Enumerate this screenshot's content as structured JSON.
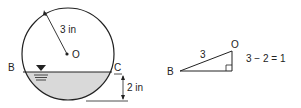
{
  "diagram": {
    "circle": {
      "radius_label": "3 in",
      "center_label": "O",
      "left_point_label": "B",
      "right_point_label": "C",
      "depth_label": "2 in"
    },
    "triangle": {
      "hypotenuse_label": "3",
      "vertex_top_label": "O",
      "vertex_left_label": "B",
      "equation": "3 − 2 = 1"
    },
    "colors": {
      "line": "#222222",
      "water_fill": "#d9d9d9"
    }
  }
}
